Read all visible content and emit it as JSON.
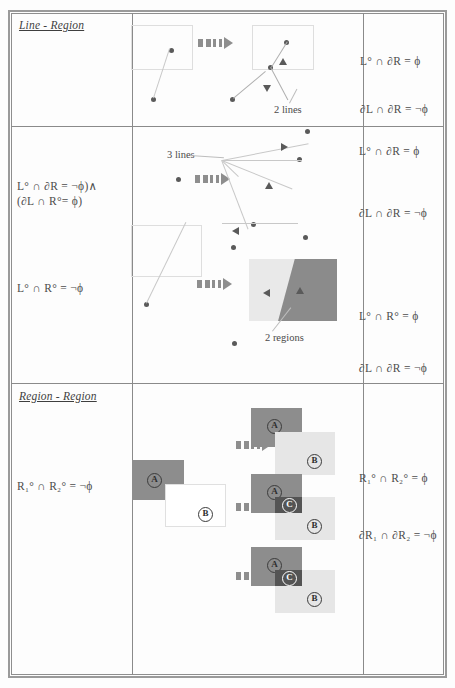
{
  "document": {
    "type": "topological-relations-table",
    "rows": [
      {
        "id": "line-region",
        "title": "Line - Region",
        "left_formulas": [],
        "right_formulas": [
          "L° ∩ ∂R = ϕ",
          "∂L ∩ ∂R = ¬ϕ"
        ],
        "annotations": [
          "2 lines"
        ]
      },
      {
        "id": "line-region-2",
        "title": "",
        "left_formulas": [
          "L° ∩ ∂R = ¬ϕ)∧",
          "(∂L ∩ R°= ϕ)",
          "L° ∩ R° = ¬ϕ"
        ],
        "right_formulas": [
          "L° ∩ ∂R = ϕ",
          "∂L ∩ ∂R = ¬ϕ",
          "L° ∩ R° = ϕ",
          "∂L ∩ ∂R = ¬ϕ"
        ],
        "annotations": [
          "3 lines",
          "2 regions"
        ]
      },
      {
        "id": "region-region",
        "title": "Region - Region",
        "left_formulas": [
          "R₁° ∩ R₂° = ¬ϕ"
        ],
        "right_formulas": [
          "R₁° ∩ R₂° = ϕ",
          "∂R₁ ∩ ∂R₂ = ¬ϕ"
        ],
        "annotations": []
      }
    ],
    "labels": {
      "region_a": "A",
      "region_b": "B",
      "region_c": "C",
      "lines_2": "2 lines",
      "lines_3": "3 lines",
      "regions_2": "2 regions"
    },
    "formulas": {
      "r1_right_1": "L° ∩ ∂R = ϕ",
      "r1_right_2": "∂L ∩ ∂R = ¬ϕ",
      "r2_left_1": "L° ∩ ∂R = ¬ϕ)∧",
      "r2_left_2": "(∂L ∩ R°= ϕ)",
      "r2_left_3": "L° ∩ R° = ¬ϕ",
      "r2_right_1": "L° ∩ ∂R = ϕ",
      "r2_right_2": "∂L ∩ ∂R = ¬ϕ",
      "r2_right_3": "L° ∩ R° = ϕ",
      "r2_right_4": "∂L ∩ ∂R = ¬ϕ",
      "r3_left_1": "R₁° ∩ R₂° = ¬ϕ",
      "r3_right_1": "R₁° ∩ R₂° = ϕ",
      "r3_right_2": "∂R₁ ∩ ∂R₂ = ¬ϕ"
    },
    "titles": {
      "row1": "Line - Region",
      "row3": "Region - Region"
    },
    "colors": {
      "region_dark": "#8d8d8d",
      "region_light": "#e6e6e6",
      "region_overlap": "#545454",
      "border": "#8a8a8a",
      "text": "#4a4a4a",
      "arrow": "#8e8e8e"
    }
  }
}
